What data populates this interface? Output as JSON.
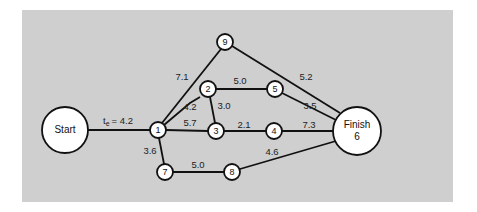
{
  "diagram": {
    "type": "PERT network",
    "nodes": {
      "start": {
        "label": "Start",
        "x": 65,
        "y": 130
      },
      "n1": {
        "label": "1",
        "x": 158,
        "y": 130
      },
      "n2": {
        "label": "2",
        "x": 208,
        "y": 89
      },
      "n3": {
        "label": "3",
        "x": 216,
        "y": 131
      },
      "n4": {
        "label": "4",
        "x": 274,
        "y": 131
      },
      "n5": {
        "label": "5",
        "x": 275,
        "y": 89
      },
      "finish": {
        "label": "Finish",
        "sublabel": "6",
        "x": 357,
        "y": 131
      },
      "n7": {
        "label": "7",
        "x": 165,
        "y": 172
      },
      "n8": {
        "label": "8",
        "x": 232,
        "y": 172
      },
      "n9": {
        "label": "9",
        "x": 225,
        "y": 42
      }
    },
    "edges": [
      {
        "from": "Start",
        "to": "1",
        "label_prefix": "t",
        "label_sub": "e",
        "label_value": "= 4.2"
      },
      {
        "from": "1",
        "to": "9",
        "label": "7.1"
      },
      {
        "from": "1",
        "to": "2",
        "label": "4.2"
      },
      {
        "from": "1",
        "to": "3",
        "label": "5.7"
      },
      {
        "from": "1",
        "to": "7",
        "label": "3.6"
      },
      {
        "from": "2",
        "to": "5",
        "label": "5.0"
      },
      {
        "from": "2",
        "to": "3",
        "label": "3.0"
      },
      {
        "from": "3",
        "to": "4",
        "label": "2.1"
      },
      {
        "from": "4",
        "to": "Finish",
        "label": "7.3"
      },
      {
        "from": "5",
        "to": "Finish",
        "label": "3.5"
      },
      {
        "from": "9",
        "to": "Finish",
        "label": "5.2"
      },
      {
        "from": "7",
        "to": "8",
        "label": "5.0"
      },
      {
        "from": "8",
        "to": "Finish",
        "label": "4.6"
      }
    ]
  }
}
